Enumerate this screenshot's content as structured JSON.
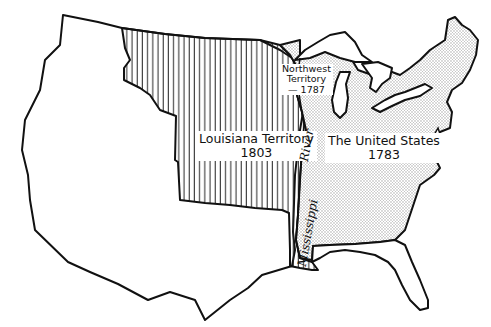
{
  "map": {
    "title": "",
    "regions": [
      {
        "id": "louisiana",
        "name": "Louisiana Territory",
        "year": "1803",
        "pattern": "vertical-hatch"
      },
      {
        "id": "united_states",
        "name": "The United States",
        "year": "1783",
        "pattern": "stipple"
      },
      {
        "id": "northwest",
        "name": "Northwest Territory",
        "year": "1787",
        "pattern": "stipple"
      },
      {
        "id": "other",
        "name": "",
        "pattern": "blank"
      }
    ],
    "labels": {
      "louisiana": {
        "line1": "Louisiana Territory",
        "line2": "1803"
      },
      "united_states": {
        "line1": "The United States",
        "line2": "1783"
      },
      "northwest": {
        "line1": "Northwest",
        "line2": "Territory",
        "line3": "— 1787"
      },
      "river": {
        "word1": "Mississippi",
        "word2": "River"
      }
    },
    "colors": {
      "outline": "#111111",
      "hatch": "#222222",
      "stipple": "#bdbdbd",
      "background": "#ffffff"
    }
  }
}
